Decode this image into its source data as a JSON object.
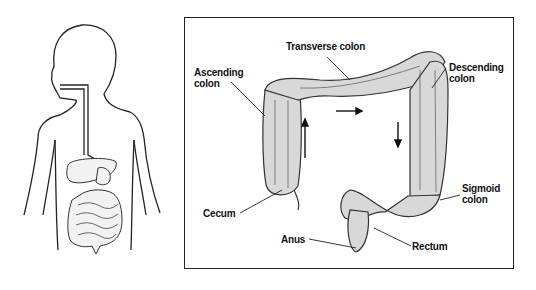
{
  "diagram": {
    "left_figure": "child-torso-digestive-system",
    "labels": {
      "transverse": "Transverse colon",
      "ascending_1": "Ascending",
      "ascending_2": "colon",
      "descending_1": "Descending",
      "descending_2": "colon",
      "cecum": "Cecum",
      "sigmoid_1": "Sigmoid",
      "sigmoid_2": "colon",
      "anus": "Anus",
      "rectum": "Rectum"
    },
    "arrows": [
      "up",
      "right",
      "down"
    ]
  }
}
